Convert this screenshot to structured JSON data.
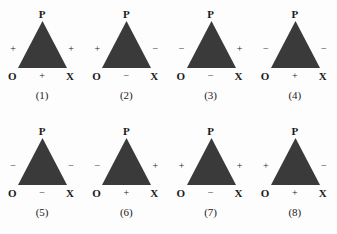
{
  "figure": {
    "background_color": "#fdfdfd",
    "triangle_fill_color": "#3a3a3a",
    "text_color": "#1a1a1a",
    "vertex_labels": {
      "apex": "P",
      "bottom_left": "O",
      "bottom_right": "X"
    },
    "rows": 2,
    "columns": 4,
    "panels": [
      {
        "caption": "(1)",
        "sign_left": "+",
        "sign_right": "+",
        "sign_bottom": "+",
        "apex": "P",
        "bottom_left": "O",
        "bottom_right": "X"
      },
      {
        "caption": "(2)",
        "sign_left": "+",
        "sign_right": "−",
        "sign_bottom": "−",
        "apex": "P",
        "bottom_left": "O",
        "bottom_right": "X"
      },
      {
        "caption": "(3)",
        "sign_left": "−",
        "sign_right": "+",
        "sign_bottom": "−",
        "apex": "P",
        "bottom_left": "O",
        "bottom_right": "X"
      },
      {
        "caption": "(4)",
        "sign_left": "−",
        "sign_right": "−",
        "sign_bottom": "+",
        "apex": "P",
        "bottom_left": "O",
        "bottom_right": "X"
      },
      {
        "caption": "(5)",
        "sign_left": "−",
        "sign_right": "−",
        "sign_bottom": "−",
        "apex": "P",
        "bottom_left": "O",
        "bottom_right": "X"
      },
      {
        "caption": "(6)",
        "sign_left": "−",
        "sign_right": "+",
        "sign_bottom": "+",
        "apex": "P",
        "bottom_left": "O",
        "bottom_right": "X"
      },
      {
        "caption": "(7)",
        "sign_left": "+",
        "sign_right": "+",
        "sign_bottom": "−",
        "apex": "P",
        "bottom_left": "O",
        "bottom_right": "X"
      },
      {
        "caption": "(8)",
        "sign_left": "+",
        "sign_right": "−",
        "sign_bottom": "+",
        "apex": "P",
        "bottom_left": "O",
        "bottom_right": "X"
      }
    ]
  }
}
